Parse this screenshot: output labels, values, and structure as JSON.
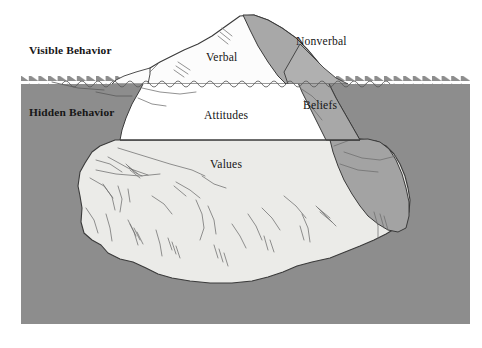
{
  "figure": {
    "type": "iceberg-diagram",
    "canvas": {
      "width": 482,
      "height": 348
    },
    "background_color": "#ffffff"
  },
  "zones": {
    "visible": {
      "label": "Visible Behavior",
      "name": "visible-behavior-zone",
      "emphasis": "bold",
      "region": "above-waterline",
      "background_color": "#ffffff"
    },
    "hidden": {
      "label": "Hidden Behavior",
      "name": "hidden-behavior-zone",
      "emphasis": "bold",
      "region": "below-waterline",
      "background_color": "#8d8d8d"
    }
  },
  "iceberg": {
    "above_water_labels": [
      {
        "key": "verbal",
        "label": "Verbal",
        "face": "light"
      },
      {
        "key": "nonverbal",
        "label": "Nonverbal",
        "face": "shadow"
      }
    ],
    "below_water_labels": [
      {
        "key": "attitudes",
        "label": "Attitudes",
        "face": "white"
      },
      {
        "key": "beliefs",
        "label": "Beliefs",
        "face": "shadow"
      },
      {
        "key": "values",
        "label": "Values",
        "face": "pale"
      }
    ],
    "colors": {
      "water": "#8d8d8d",
      "water_deep": "#8a8a8a",
      "ice_white": "#ffffff",
      "ice_pale": "#ebebe8",
      "ice_shadow": "#a8a8a8",
      "ice_shadow_deep": "#a3a3a3",
      "outline": "#3a3a3a",
      "crack": "#6e6e6e",
      "text": "#161616"
    },
    "waterline": {
      "style": "sawtooth",
      "wave_style": "sine-ripples",
      "y": 78
    }
  },
  "annotations": {
    "waterline_name": "waterline-sawtooth",
    "ripple_name": "water-ripple-line"
  }
}
